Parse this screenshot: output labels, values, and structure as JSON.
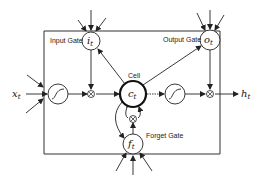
{
  "diagram": {
    "colors": {
      "stroke": "#222222",
      "background": "#ffffff"
    },
    "nodes": {
      "input_gate": {
        "label": "Input Gate",
        "var": "i",
        "sub": "t"
      },
      "output_gate": {
        "label": "Output Gate",
        "var": "o",
        "sub": "t"
      },
      "cell": {
        "label": "Cell",
        "var": "c",
        "sub": "t"
      },
      "forget_gate": {
        "label": "Forget Gate",
        "var": "f",
        "sub": "t"
      },
      "input": {
        "var": "x",
        "sub": "t"
      },
      "output": {
        "var": "h",
        "sub": "t"
      },
      "multiply_symbol": "⊗"
    }
  }
}
